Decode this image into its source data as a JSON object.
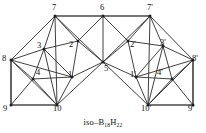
{
  "figure": {
    "caption_prefix": "iso–B",
    "caption_boron_count": "18",
    "caption_hydrogen_symbol": "H",
    "caption_hydrogen_count": "22",
    "caption_full": "iso–B18H22",
    "line_color": "#2b2b2b",
    "accent_line_color": "#4a4a4a",
    "node_color": "#1e1e1e",
    "background_color": "#ffffff"
  },
  "chart_data": {
    "type": "diagram",
    "subtype": "graph-projection",
    "title": "iso–B18H22",
    "xlim": [
      0,
      206
    ],
    "ylim": [
      0,
      133
    ],
    "grid": false,
    "legend": null,
    "nodes": [
      {
        "id": "1",
        "label": "1",
        "x": 72,
        "y": 77,
        "label_x": 68,
        "label_y": 70
      },
      {
        "id": "2",
        "label": "2",
        "x": 78,
        "y": 41,
        "label_x": 69,
        "label_y": 40
      },
      {
        "id": "3",
        "label": "3",
        "x": 44,
        "y": 49,
        "label_x": 37,
        "label_y": 41
      },
      {
        "id": "4",
        "label": "4",
        "x": 33,
        "y": 79,
        "label_x": 36,
        "label_y": 68
      },
      {
        "id": "5",
        "label": "5",
        "x": 103,
        "y": 62,
        "label_x": 104,
        "label_y": 64
      },
      {
        "id": "6",
        "label": "6",
        "x": 103,
        "y": 16,
        "label_x": 100,
        "label_y": 3
      },
      {
        "id": "7",
        "label": "7",
        "x": 55,
        "y": 16,
        "label_x": 52,
        "label_y": 3
      },
      {
        "id": "8",
        "label": "8",
        "x": 11,
        "y": 60,
        "label_x": 2,
        "label_y": 54
      },
      {
        "id": "9",
        "label": "9",
        "x": 11,
        "y": 105,
        "label_x": 3,
        "label_y": 104
      },
      {
        "id": "10",
        "label": "10",
        "x": 57,
        "y": 105,
        "label_x": 53,
        "label_y": 104
      },
      {
        "id": "1p",
        "label": "1'",
        "x": 136,
        "y": 77,
        "label_x": 130,
        "label_y": 70
      },
      {
        "id": "2p",
        "label": "2'",
        "x": 128,
        "y": 41,
        "label_x": 130,
        "label_y": 40
      },
      {
        "id": "3p",
        "label": "3'",
        "x": 163,
        "y": 46,
        "label_x": 160,
        "label_y": 38
      },
      {
        "id": "4p",
        "label": "4'",
        "x": 172,
        "y": 79,
        "label_x": 157,
        "label_y": 68
      },
      {
        "id": "7p",
        "label": "7'",
        "x": 150,
        "y": 16,
        "label_x": 147,
        "label_y": 3
      },
      {
        "id": "8p",
        "label": "8'",
        "x": 193,
        "y": 60,
        "label_x": 192,
        "label_y": 54
      },
      {
        "id": "9p",
        "label": "9'",
        "x": 193,
        "y": 105,
        "label_x": 188,
        "label_y": 104
      },
      {
        "id": "10p",
        "label": "10'",
        "x": 148,
        "y": 105,
        "label_x": 141,
        "label_y": 104
      }
    ],
    "edges": [
      {
        "from": "7",
        "to": "6",
        "style": "thick"
      },
      {
        "from": "6",
        "to": "7p",
        "style": "thick"
      },
      {
        "from": "8",
        "to": "9",
        "style": "thick"
      },
      {
        "from": "9",
        "to": "10",
        "style": "thick"
      },
      {
        "from": "8p",
        "to": "9p",
        "style": "thick"
      },
      {
        "from": "10p",
        "to": "9p",
        "style": "thick"
      },
      {
        "from": "7",
        "to": "8",
        "style": "thin"
      },
      {
        "from": "7",
        "to": "3",
        "style": "thin"
      },
      {
        "from": "7",
        "to": "2",
        "style": "thin"
      },
      {
        "from": "7",
        "to": "5",
        "style": "thin"
      },
      {
        "from": "7",
        "to": "10",
        "style": "thin"
      },
      {
        "from": "6",
        "to": "2",
        "style": "thin"
      },
      {
        "from": "6",
        "to": "5",
        "style": "thin"
      },
      {
        "from": "6",
        "to": "2p",
        "style": "thin"
      },
      {
        "from": "8",
        "to": "3",
        "style": "thin"
      },
      {
        "from": "8",
        "to": "4",
        "style": "thin"
      },
      {
        "from": "8",
        "to": "1",
        "style": "thin"
      },
      {
        "from": "8",
        "to": "10",
        "style": "thin"
      },
      {
        "from": "3",
        "to": "2",
        "style": "thin"
      },
      {
        "from": "3",
        "to": "4",
        "style": "thin"
      },
      {
        "from": "3",
        "to": "1",
        "style": "thin"
      },
      {
        "from": "3",
        "to": "10",
        "style": "thin"
      },
      {
        "from": "2",
        "to": "1",
        "style": "thin"
      },
      {
        "from": "2",
        "to": "5",
        "style": "thin"
      },
      {
        "from": "4",
        "to": "9",
        "style": "thin"
      },
      {
        "from": "4",
        "to": "1",
        "style": "thin"
      },
      {
        "from": "4",
        "to": "10",
        "style": "thin"
      },
      {
        "from": "1",
        "to": "10",
        "style": "thin"
      },
      {
        "from": "1",
        "to": "5",
        "style": "thin"
      },
      {
        "from": "7p",
        "to": "8p",
        "style": "thin"
      },
      {
        "from": "7p",
        "to": "3p",
        "style": "thin"
      },
      {
        "from": "7p",
        "to": "2p",
        "style": "thin"
      },
      {
        "from": "7p",
        "to": "5",
        "style": "thin"
      },
      {
        "from": "7p",
        "to": "10p",
        "style": "thin"
      },
      {
        "from": "8p",
        "to": "3p",
        "style": "thin"
      },
      {
        "from": "8p",
        "to": "4p",
        "style": "thin"
      },
      {
        "from": "8p",
        "to": "1p",
        "style": "thin"
      },
      {
        "from": "8p",
        "to": "10p",
        "style": "thin"
      },
      {
        "from": "3p",
        "to": "2p",
        "style": "thin"
      },
      {
        "from": "3p",
        "to": "4p",
        "style": "thin"
      },
      {
        "from": "3p",
        "to": "1p",
        "style": "thin"
      },
      {
        "from": "3p",
        "to": "10p",
        "style": "thin"
      },
      {
        "from": "2p",
        "to": "1p",
        "style": "thin"
      },
      {
        "from": "2p",
        "to": "5",
        "style": "thin"
      },
      {
        "from": "4p",
        "to": "9p",
        "style": "thin"
      },
      {
        "from": "4p",
        "to": "1p",
        "style": "thin"
      },
      {
        "from": "4p",
        "to": "10p",
        "style": "thin"
      },
      {
        "from": "1p",
        "to": "10p",
        "style": "thin"
      },
      {
        "from": "1p",
        "to": "5",
        "style": "thin"
      },
      {
        "from": "5",
        "to": "10",
        "style": "thin"
      },
      {
        "from": "5",
        "to": "10p",
        "style": "thin"
      }
    ]
  }
}
